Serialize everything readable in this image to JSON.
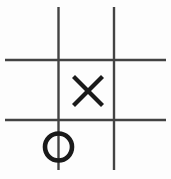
{
  "canvas": {
    "width": 171,
    "height": 179,
    "background_color": "#fdfdfd",
    "title": "tic-tac-toe-board"
  },
  "board": {
    "name": "tic-tac-toe grid",
    "line_color": "#434343",
    "line_width": 2.4,
    "vertical_lines": [
      {
        "name": "vertical-line-left",
        "x": 58.5,
        "y1": 7,
        "y2": 170
      },
      {
        "name": "vertical-line-right",
        "x": 114.0,
        "y1": 7,
        "y2": 170
      }
    ],
    "horizontal_lines": [
      {
        "name": "horizontal-line-top",
        "y": 60.0,
        "x1": 5,
        "x2": 166
      },
      {
        "name": "horizontal-line-bottom",
        "y": 120.0,
        "x1": 5,
        "x2": 166
      }
    ]
  },
  "marks": [
    {
      "name": "mark-x-center",
      "symbol": "X",
      "player": "X",
      "cell": "middle-center",
      "row": 2,
      "column": 2,
      "color": "#1a1a1a",
      "stroke_width": 4.2,
      "center_x": 88,
      "center_y": 91,
      "size": 30,
      "x1": 73.5,
      "y1": 76.5,
      "x2": 102.5,
      "y2": 105.5
    },
    {
      "name": "mark-o-bottom-left",
      "symbol": "O",
      "player": "O",
      "cell": "bottom-left",
      "row": 3,
      "column": 1,
      "color": "#1a1a1a",
      "stroke_width": 4.6,
      "center_x": 58.5,
      "center_y": 147,
      "radius": 13.5
    }
  ],
  "game_state": {
    "moves_played": 2,
    "x_positions": [
      "middle-center"
    ],
    "o_positions": [
      "bottom-left"
    ],
    "empty_cells": [
      "top-left",
      "top-center",
      "top-right",
      "middle-left",
      "middle-right",
      "bottom-center",
      "bottom-right"
    ]
  }
}
